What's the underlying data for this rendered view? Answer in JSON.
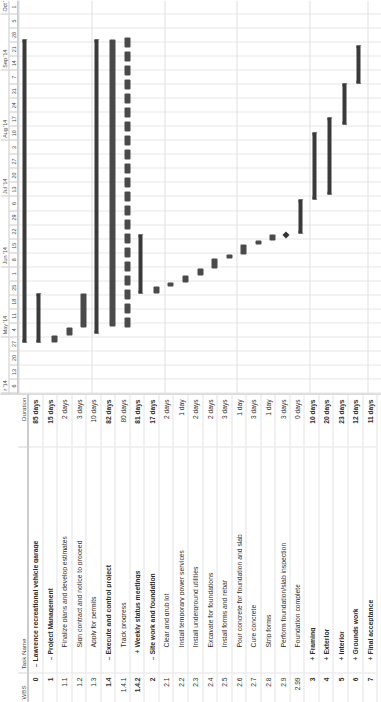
{
  "app": "microsoft-project-gantt",
  "columns": {
    "wbs": "WBS",
    "task_name": "Task Name",
    "duration": "Duration"
  },
  "timeline": {
    "months": [
      {
        "label": "r '14",
        "weeks": 4
      },
      {
        "label": "May '14",
        "weeks": 5
      },
      {
        "label": "Jun '14",
        "weeks": 5
      },
      {
        "label": "Jul '14",
        "weeks": 4
      },
      {
        "label": "Aug '14",
        "weeks": 5
      },
      {
        "label": "Sep '14",
        "weeks": 4
      },
      {
        "label": "Oct '1",
        "weeks": 2
      }
    ],
    "weeks": [
      "6",
      "13",
      "20",
      "27",
      "4",
      "11",
      "18",
      "25",
      "1",
      "8",
      "15",
      "22",
      "29",
      "6",
      "13",
      "20",
      "27",
      "3",
      "10",
      "17",
      "24",
      "31",
      "7",
      "14",
      "21",
      "28",
      "5",
      "1"
    ]
  },
  "rows": [
    {
      "wbs": "0",
      "toggle": "–",
      "indent": 0,
      "name": "Lawrence recreational vehicle garage",
      "duration": "85 days",
      "summary": true,
      "bar": {
        "type": "summary",
        "start": 3.6,
        "end": 25.2
      }
    },
    {
      "wbs": "1",
      "toggle": "–",
      "indent": 1,
      "name": "Project Management",
      "duration": "15 days",
      "summary": true,
      "bar": {
        "type": "summary",
        "start": 3.6,
        "end": 7.1
      }
    },
    {
      "wbs": "1.1",
      "toggle": "",
      "indent": 2,
      "name": "Finalize plans and develop estimates",
      "duration": "2 days",
      "summary": false,
      "bar": {
        "type": "task",
        "start": 3.6,
        "end": 4.1
      }
    },
    {
      "wbs": "1.2",
      "toggle": "",
      "indent": 2,
      "name": "Sign contract and notice to proceed",
      "duration": "3 days",
      "summary": false,
      "bar": {
        "type": "task",
        "start": 4.1,
        "end": 4.7
      }
    },
    {
      "wbs": "1.3",
      "toggle": "",
      "indent": 2,
      "name": "Apply for permits",
      "duration": "10 days",
      "summary": false,
      "bar": {
        "type": "task",
        "start": 4.7,
        "end": 7.1
      }
    },
    {
      "wbs": "1.4",
      "toggle": "–",
      "indent": 1,
      "name": "Execute and control project",
      "duration": "82 days",
      "summary": true,
      "bar": {
        "type": "summary",
        "start": 4.3,
        "end": 25.2
      }
    },
    {
      "wbs": "1.4.1",
      "toggle": "",
      "indent": 2,
      "name": "Track progress",
      "duration": "80 days",
      "summary": false,
      "bar": {
        "type": "task",
        "start": 4.8,
        "end": 25.2
      }
    },
    {
      "wbs": "1.4.2",
      "toggle": "+",
      "indent": 2,
      "name": "Weekly status meetings",
      "duration": "81 days",
      "summary": true,
      "bar": {
        "type": "recurring",
        "start": 4.6,
        "end": 25.2
      }
    },
    {
      "wbs": "2",
      "toggle": "–",
      "indent": 1,
      "name": "Site work and foundation",
      "duration": "17 days",
      "summary": true,
      "bar": {
        "type": "summary",
        "start": 7.1,
        "end": 11.3
      }
    },
    {
      "wbs": "2.1",
      "toggle": "",
      "indent": 2,
      "name": "Clear and grub lot",
      "duration": "2 days",
      "summary": false,
      "bar": {
        "type": "task",
        "start": 7.1,
        "end": 7.6
      }
    },
    {
      "wbs": "2.2",
      "toggle": "",
      "indent": 2,
      "name": "Install temporary power services",
      "duration": "1 day",
      "summary": false,
      "bar": {
        "type": "task",
        "start": 7.6,
        "end": 7.9
      }
    },
    {
      "wbs": "2.3",
      "toggle": "",
      "indent": 2,
      "name": "Install underground utilities",
      "duration": "2 days",
      "summary": false,
      "bar": {
        "type": "task",
        "start": 7.9,
        "end": 8.4
      }
    },
    {
      "wbs": "2.4",
      "toggle": "",
      "indent": 2,
      "name": "Excavate for foundations",
      "duration": "2 days",
      "summary": false,
      "bar": {
        "type": "task",
        "start": 8.4,
        "end": 8.9
      }
    },
    {
      "wbs": "2.5",
      "toggle": "",
      "indent": 2,
      "name": "Install forms and rebar",
      "duration": "3 days",
      "summary": false,
      "bar": {
        "type": "task",
        "start": 8.9,
        "end": 9.6
      }
    },
    {
      "wbs": "2.6",
      "toggle": "",
      "indent": 2,
      "name": "Pour concrete for foundation and slab",
      "duration": "1 day",
      "summary": false,
      "bar": {
        "type": "task",
        "start": 9.6,
        "end": 9.9
      }
    },
    {
      "wbs": "2.7",
      "toggle": "",
      "indent": 2,
      "name": "Cure concrete",
      "duration": "3 days",
      "summary": false,
      "bar": {
        "type": "task",
        "start": 9.9,
        "end": 10.6
      }
    },
    {
      "wbs": "2.8",
      "toggle": "",
      "indent": 2,
      "name": "Strip forms",
      "duration": "1 day",
      "summary": false,
      "bar": {
        "type": "task",
        "start": 10.6,
        "end": 10.9
      }
    },
    {
      "wbs": "2.9",
      "toggle": "",
      "indent": 2,
      "name": "Perform foundation/slab inspection",
      "duration": "3 days",
      "summary": false,
      "bar": {
        "type": "task",
        "start": 10.9,
        "end": 11.3
      }
    },
    {
      "wbs": "2.99",
      "toggle": "",
      "indent": 2,
      "name": "Foundation complete",
      "duration": "0 days",
      "summary": false,
      "bar": {
        "type": "milestone",
        "start": 11.3,
        "end": 11.3
      }
    },
    {
      "wbs": "3",
      "toggle": "+",
      "indent": 1,
      "name": "Framing",
      "duration": "10 days",
      "summary": true,
      "bar": {
        "type": "summary",
        "start": 11.4,
        "end": 13.8
      }
    },
    {
      "wbs": "4",
      "toggle": "+",
      "indent": 1,
      "name": "Exterior",
      "duration": "20 days",
      "summary": true,
      "bar": {
        "type": "summary",
        "start": 13.8,
        "end": 18.6
      }
    },
    {
      "wbs": "5",
      "toggle": "+",
      "indent": 1,
      "name": "Interior",
      "duration": "23 days",
      "summary": true,
      "bar": {
        "type": "summary",
        "start": 14.2,
        "end": 19.7
      }
    },
    {
      "wbs": "6",
      "toggle": "+",
      "indent": 1,
      "name": "Grounds work",
      "duration": "12 days",
      "summary": true,
      "bar": {
        "type": "summary",
        "start": 19.2,
        "end": 22.1
      }
    },
    {
      "wbs": "7",
      "toggle": "+",
      "indent": 1,
      "name": "Final acceptance",
      "duration": "11 days",
      "summary": true,
      "bar": {
        "type": "summary",
        "start": 22.1,
        "end": 24.8
      }
    }
  ],
  "chart_data": {
    "type": "bar",
    "title": "Lawrence recreational vehicle garage",
    "xlabel": "Timeline (weeks)",
    "ylabel": "Task",
    "categories": [
      "Lawrence recreational vehicle garage",
      "Project Management",
      "Finalize plans and develop estimates",
      "Sign contract and notice to proceed",
      "Apply for permits",
      "Execute and control project",
      "Track progress",
      "Weekly status meetings",
      "Site work and foundation",
      "Clear and grub lot",
      "Install temporary power services",
      "Install underground utilities",
      "Excavate for foundations",
      "Install forms and rebar",
      "Pour concrete for foundation and slab",
      "Cure concrete",
      "Strip forms",
      "Perform foundation/slab inspection",
      "Foundation complete",
      "Framing",
      "Exterior",
      "Interior",
      "Grounds work",
      "Final acceptance"
    ],
    "values": [
      85,
      15,
      2,
      3,
      10,
      82,
      80,
      81,
      17,
      2,
      1,
      2,
      2,
      3,
      1,
      3,
      1,
      3,
      0,
      10,
      20,
      23,
      12,
      11
    ],
    "value_unit": "days",
    "axis_ticks": [
      "6",
      "13",
      "20",
      "27",
      "4",
      "11",
      "18",
      "25",
      "1",
      "8",
      "15",
      "22",
      "29",
      "6",
      "13",
      "20",
      "27",
      "3",
      "10",
      "17",
      "24",
      "31",
      "7",
      "14",
      "21",
      "28",
      "5",
      "1"
    ],
    "grid": true,
    "legend": "none"
  }
}
